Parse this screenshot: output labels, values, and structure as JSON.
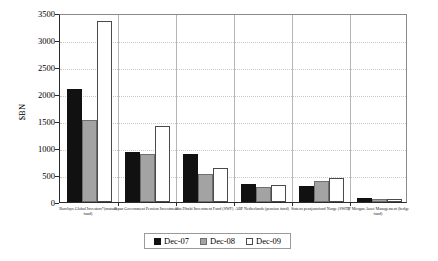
{
  "chart_data": {
    "type": "bar",
    "title": "",
    "xlabel": "",
    "ylabel": "$BN",
    "ylim": [
      0,
      3500
    ],
    "ytick_step": 500,
    "yticks": [
      "0",
      "500",
      "1000",
      "1500",
      "2000",
      "2500",
      "3000",
      "3500"
    ],
    "grid": true,
    "legend_position": "bottom-center",
    "categories": [
      "Barclays Global Investors*(mutual fund)",
      "Japan Government Pension Investment",
      "Abu Dhabi Investment Fund (SWF)",
      "ABP Netherlands (pension fund)",
      "Statens pensjonsfond Norge (SWF)",
      "JP Morgan Asset Management (hedge fund)"
    ],
    "series": [
      {
        "name": "Dec-07",
        "color": "#111111",
        "values": [
          2100,
          935,
          880,
          330,
          290,
          80
        ]
      },
      {
        "name": "Dec-08",
        "color": "#a3a3a3",
        "values": [
          1510,
          880,
          510,
          270,
          390,
          60
        ]
      },
      {
        "name": "Dec-09",
        "color": "#ffffff",
        "values": [
          3350,
          1400,
          630,
          310,
          450,
          65
        ]
      }
    ]
  },
  "legend": {
    "items": [
      {
        "label": "Dec-07"
      },
      {
        "label": "Dec-08"
      },
      {
        "label": "Dec-09"
      }
    ]
  }
}
